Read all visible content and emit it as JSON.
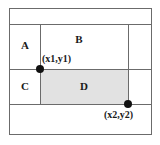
{
  "figure": {
    "title": "",
    "background_color": "#ffffff",
    "frame_color": "#6b6b6b",
    "shade_color": "#e2e2e2",
    "dot_color": "#111111",
    "text_color": "#1a1a1a"
  },
  "regions": [
    {
      "id": "A",
      "label": "A",
      "shaded": false
    },
    {
      "id": "B",
      "label": "B",
      "shaded": false
    },
    {
      "id": "C",
      "label": "C",
      "shaded": false
    },
    {
      "id": "D",
      "label": "D",
      "shaded": true
    }
  ],
  "points": [
    {
      "id": "p1",
      "label": "(x1,y1)"
    },
    {
      "id": "p2",
      "label": "(x2,y2)"
    }
  ],
  "chart_data": {
    "type": "diagram",
    "title": "",
    "xlabel": "",
    "ylabel": "",
    "categories": [
      "A",
      "B",
      "C",
      "D"
    ],
    "values": [
      0,
      0,
      0,
      1
    ],
    "annotations": [
      "(x1,y1)",
      "(x2,y2)"
    ],
    "grid": true,
    "legend": "none"
  }
}
